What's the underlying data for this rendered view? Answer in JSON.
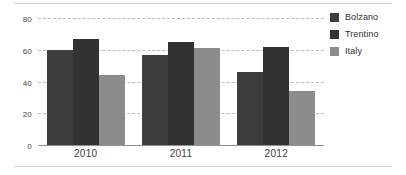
{
  "chart_data": {
    "type": "bar",
    "title": "",
    "subtitle": "",
    "xlabel": "",
    "ylabel": "",
    "categories": [
      "2010",
      "2011",
      "2012"
    ],
    "series": [
      {
        "name": "Bolzano",
        "color": "#3d3d3d",
        "values": [
          60,
          57,
          46
        ]
      },
      {
        "name": "Trentino",
        "color": "#323232",
        "values": [
          67,
          65,
          62
        ]
      },
      {
        "name": "Italy",
        "color": "#8c8c8c",
        "values": [
          44,
          61,
          34
        ]
      }
    ],
    "ylim": [
      0,
      80
    ],
    "yticks": [
      0,
      20,
      40,
      60,
      80
    ],
    "ytick_labels": [
      "0",
      "20",
      "40",
      "60",
      "80"
    ],
    "grid": true,
    "grid_style": "dashed-horizontal",
    "legend_position": "right-top",
    "annotations": []
  },
  "figure": {
    "background_color": "#ffffff",
    "frame_color": "#cfcfcf",
    "axis_color": "#8f8f8f",
    "gridline_color": "#b9b9b9",
    "tick_label_color": "#4a4a4a"
  }
}
